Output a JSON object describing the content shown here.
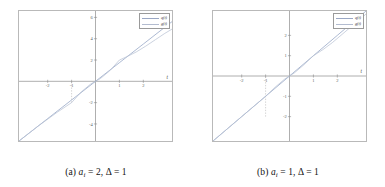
{
  "figure": {
    "panels": [
      {
        "id": "panel-a",
        "caption_prefix": "(a)",
        "caption_var": "a",
        "caption_sub": "i",
        "caption_rest": "= 2,",
        "caption_delta": "Δ = 1",
        "axis_label_x": "t",
        "legend": [
          {
            "label": "q(t)"
          },
          {
            "label": "g(t)"
          }
        ],
        "chart_data": {
          "type": "line",
          "title": "",
          "xlabel": "t",
          "ylabel": "",
          "xlim": [
            -3.2,
            3.2
          ],
          "ylim": [
            -5.6,
            6.6
          ],
          "grid": false,
          "legend_position": "top-right",
          "xticks": [
            -2,
            -1,
            1,
            2
          ],
          "yticks": [
            -4,
            -2,
            2,
            4,
            6
          ],
          "annotations": [
            {
              "type": "dashed-vline",
              "x": -1,
              "y_from": -2,
              "y_to": 0
            }
          ],
          "series": [
            {
              "name": "q(t)",
              "color": "#8fa0c2",
              "x": [
                -3.2,
                -2,
                -1,
                0,
                1,
                2,
                3.2
              ],
              "values": [
                -5.6,
                -3.5,
                -1.75,
                0,
                1.75,
                3.5,
                5.6
              ]
            },
            {
              "name": "g(t)",
              "color": "#b9c2d4",
              "x": [
                -3.2,
                -2.4,
                -1.6,
                -1.0,
                -0.6,
                -0.2,
                0,
                0.2,
                0.6,
                1.0,
                1.3,
                1.7,
                2.1,
                2.5,
                2.9,
                3.2
              ],
              "values": [
                -5.6,
                -4.2,
                -2.9,
                -2.0,
                -1.0,
                -0.25,
                0,
                0.25,
                1.0,
                2.0,
                2.3,
                2.75,
                3.3,
                3.9,
                4.5,
                4.9
              ]
            }
          ]
        }
      },
      {
        "id": "panel-b",
        "caption_prefix": "(b)",
        "caption_var": "a",
        "caption_sub": "i",
        "caption_rest": "= 1,",
        "caption_delta": "Δ = 1",
        "axis_label_x": "t",
        "legend": [
          {
            "label": "q(t)"
          },
          {
            "label": "g(t)"
          }
        ],
        "chart_data": {
          "type": "line",
          "title": "",
          "xlabel": "t",
          "ylabel": "",
          "xlim": [
            -3.2,
            3.2
          ],
          "ylim": [
            -3.2,
            3.2
          ],
          "grid": false,
          "legend_position": "top-right",
          "xticks": [
            -2,
            -1,
            1,
            2
          ],
          "yticks": [
            -2,
            -1,
            1,
            2
          ],
          "annotations": [
            {
              "type": "dashed-vline",
              "x": -1,
              "y_from": -2,
              "y_to": 0
            }
          ],
          "series": [
            {
              "name": "q(t)",
              "color": "#8fa0c2",
              "x": [
                -3.2,
                -2,
                -1,
                0,
                1,
                2,
                3.2
              ],
              "values": [
                -3.2,
                -2.0,
                -1.0,
                0,
                1.0,
                2.0,
                3.2
              ]
            },
            {
              "name": "g(t)",
              "color": "#b9c2d4",
              "x": [
                -3.2,
                -2.5,
                -2.0,
                -1.5,
                -1.0,
                -0.6,
                -0.2,
                0,
                0.2,
                0.6,
                1.0,
                1.4,
                1.8,
                2.2,
                2.6,
                3.0,
                3.2
              ],
              "values": [
                -3.2,
                -2.5,
                -2.0,
                -1.5,
                -1.0,
                -0.55,
                -0.15,
                0,
                0.15,
                0.55,
                1.0,
                1.3,
                1.65,
                2.05,
                2.45,
                2.85,
                3.05
              ]
            }
          ]
        }
      }
    ]
  }
}
